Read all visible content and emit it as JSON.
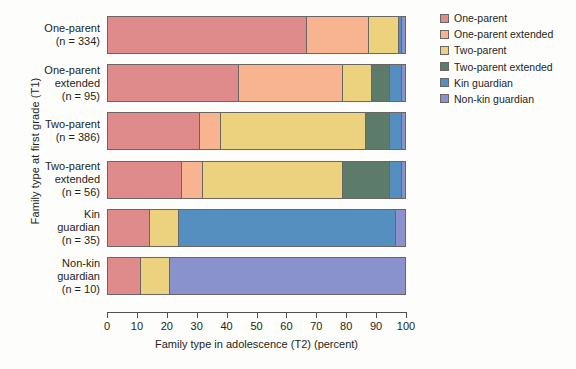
{
  "chart_data": {
    "type": "bar",
    "subtype": "horizontal-stacked-percentage",
    "title": "",
    "xlabel": "Family type in adolescence (T2) (percent)",
    "ylabel": "Family type at first grade (T1)",
    "xlim": [
      0,
      100
    ],
    "xticks": [
      0,
      10,
      20,
      30,
      40,
      50,
      60,
      70,
      80,
      90,
      100
    ],
    "grid": false,
    "legend_position": "right",
    "categories": [
      "One-parent (n = 334)",
      "One-parent extended (n = 95)",
      "Two-parent (n = 386)",
      "Two-parent extended (n = 56)",
      "Kin guardian (n = 35)",
      "Non-kin guardian (n = 10)"
    ],
    "category_lines": [
      [
        "One-parent",
        "(n = 334)"
      ],
      [
        "One-parent",
        "extended",
        "(n = 95)"
      ],
      [
        "Two-parent",
        "(n = 386)"
      ],
      [
        "Two-parent",
        "extended",
        "(n = 56)"
      ],
      [
        "Kin",
        "guardian",
        "(n = 35)"
      ],
      [
        "Non-kin",
        "guardian",
        "(n = 10)"
      ]
    ],
    "series": [
      {
        "name": "One-parent",
        "color": "#e08b8b",
        "values": [
          67,
          44,
          31,
          25,
          14,
          11
        ]
      },
      {
        "name": "One-parent extended",
        "color": "#f8b391",
        "values": [
          21,
          35,
          7,
          7,
          0,
          0
        ]
      },
      {
        "name": "Two-parent",
        "color": "#ecd27f",
        "values": [
          10,
          10,
          49,
          47,
          10,
          10
        ]
      },
      {
        "name": "Two-parent extended",
        "color": "#5d7b6b",
        "values": [
          0,
          6,
          8,
          16,
          0,
          0
        ]
      },
      {
        "name": "Kin guardian",
        "color": "#548fc0",
        "values": [
          1,
          4,
          4,
          4,
          73,
          0
        ]
      },
      {
        "name": "Non-kin guardian",
        "color": "#8a92cd",
        "values": [
          1,
          1,
          1,
          1,
          3,
          79
        ]
      }
    ],
    "legend": [
      {
        "label": "One-parent",
        "color": "#e08b8b"
      },
      {
        "label": "One-parent extended",
        "color": "#f8b391"
      },
      {
        "label": "Two-parent",
        "color": "#ecd27f"
      },
      {
        "label": "Two-parent extended",
        "color": "#5d7b6b"
      },
      {
        "label": "Kin guardian",
        "color": "#548fc0"
      },
      {
        "label": "Non-kin guardian",
        "color": "#8a92cd"
      }
    ]
  }
}
